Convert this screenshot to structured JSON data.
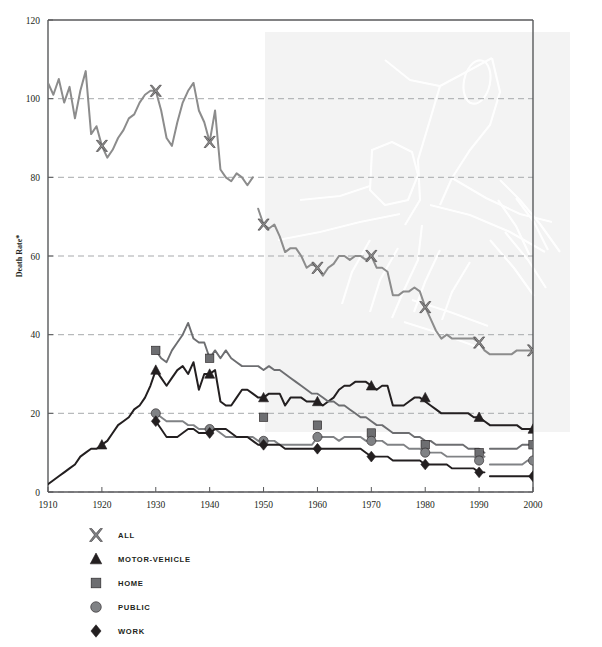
{
  "chart_data": {
    "type": "line",
    "title": "",
    "xlabel": "",
    "ylabel": "Death Rate*",
    "xlim": [
      1910,
      2000
    ],
    "ylim": [
      0,
      120
    ],
    "grid": "horizontal-dashed",
    "legend_position": "below-left",
    "xticks": [
      "1910",
      "1920",
      "1930",
      "1940",
      "1950",
      "1960",
      "1970",
      "1980",
      "1990",
      "2000"
    ],
    "yticks": [
      "0",
      "20",
      "40",
      "60",
      "80",
      "100",
      "120"
    ],
    "annotations": {
      "shaded_band_note": "light grey shaded band spanning 1950-2000 at upper portion of plot, with faint line-art watermark"
    },
    "series": [
      {
        "name": "ALL",
        "marker": "x-cross",
        "color": "#8c8c8c",
        "marker_years": [
          1920,
          1930,
          1940,
          1950,
          1960,
          1970,
          1980,
          1990,
          2000
        ],
        "marker_values": [
          88,
          102,
          89,
          68,
          57,
          60,
          47,
          38,
          36
        ],
        "segments": [
          {
            "x": [
              1910,
              1911,
              1912,
              1913,
              1914,
              1915,
              1916,
              1917,
              1918,
              1919,
              1920,
              1921,
              1922,
              1923,
              1924,
              1925,
              1926,
              1927,
              1928,
              1929,
              1930,
              1931,
              1932,
              1933,
              1934,
              1935,
              1936,
              1937,
              1938,
              1939,
              1940,
              1941,
              1942,
              1943,
              1944,
              1945,
              1946,
              1947,
              1948
            ],
            "y": [
              104,
              101,
              105,
              99,
              103,
              95,
              102,
              107,
              91,
              93,
              88,
              85,
              87,
              90,
              92,
              95,
              96,
              99,
              101,
              102,
              102,
              97,
              90,
              88,
              94,
              99,
              102,
              104,
              97,
              94,
              89,
              97,
              82,
              80,
              79,
              81,
              80,
              78,
              80
            ]
          },
          {
            "x": [
              1949,
              1950,
              1951,
              1952,
              1953,
              1954,
              1955,
              1956,
              1957,
              1958,
              1959,
              1960,
              1961,
              1962,
              1963,
              1964,
              1965,
              1966,
              1967,
              1968,
              1969,
              1970,
              1971,
              1972,
              1973,
              1974,
              1975,
              1976,
              1977,
              1978,
              1979,
              1980,
              1981,
              1982,
              1983,
              1984,
              1985,
              1986,
              1987,
              1988,
              1989,
              1990,
              1991,
              1992,
              1993,
              1994,
              1995,
              1996,
              1997,
              1998,
              1999,
              2000
            ],
            "y": [
              72,
              68,
              67,
              68,
              65,
              61,
              62,
              62,
              60,
              57,
              58,
              57,
              55,
              57,
              58,
              60,
              60,
              59,
              60,
              60,
              59,
              60,
              57,
              57,
              56,
              50,
              50,
              51,
              51,
              52,
              51,
              47,
              44,
              41,
              39,
              40,
              39,
              39,
              39,
              39,
              39,
              38,
              36,
              35,
              35,
              35,
              35,
              35,
              36,
              36,
              36,
              36
            ]
          }
        ]
      },
      {
        "name": "MOTOR-VEHICLE",
        "marker": "triangle",
        "color": "#231f20",
        "marker_years": [
          1920,
          1930,
          1940,
          1950,
          1960,
          1970,
          1980,
          1990,
          2000
        ],
        "marker_values": [
          12,
          31,
          30,
          24,
          23,
          27,
          24,
          19,
          16
        ],
        "segments": [
          {
            "x": [
              1910,
              1911,
              1912,
              1913,
              1914,
              1915,
              1916,
              1917,
              1918,
              1919,
              1920,
              1921,
              1922,
              1923,
              1924,
              1925,
              1926,
              1927,
              1928,
              1929,
              1930,
              1931,
              1932,
              1933,
              1934,
              1935,
              1936,
              1937,
              1938,
              1939,
              1940,
              1941,
              1942,
              1943,
              1944,
              1945,
              1946,
              1947,
              1948,
              1949,
              1950,
              1951,
              1952,
              1953,
              1954,
              1955,
              1956,
              1957,
              1958,
              1959,
              1960,
              1961,
              1962,
              1963,
              1964,
              1965,
              1966,
              1967,
              1968,
              1969,
              1970,
              1971,
              1972,
              1973,
              1974,
              1975,
              1976,
              1977,
              1978,
              1979,
              1980,
              1981,
              1982,
              1983,
              1984,
              1985,
              1986,
              1987,
              1988,
              1989,
              1990,
              1991,
              1992,
              1993,
              1994,
              1995,
              1996,
              1997,
              1998,
              1999,
              2000
            ],
            "y": [
              2,
              3,
              4,
              5,
              6,
              7,
              9,
              10,
              11,
              11,
              12,
              13,
              15,
              17,
              18,
              19,
              21,
              22,
              24,
              27,
              31,
              29,
              27,
              29,
              31,
              32,
              30,
              33,
              26,
              30,
              30,
              31,
              23,
              22,
              22,
              24,
              26,
              26,
              25,
              24,
              24,
              25,
              25,
              25,
              22,
              24,
              24,
              24,
              23,
              23,
              23,
              22,
              23,
              24,
              26,
              27,
              27,
              28,
              28,
              28,
              27,
              26,
              27,
              27,
              22,
              22,
              22,
              23,
              24,
              24,
              23,
              22,
              21,
              20,
              20,
              20,
              20,
              20,
              20,
              19,
              19,
              18,
              17,
              17,
              17,
              17,
              17,
              17,
              16,
              16,
              16
            ]
          }
        ]
      },
      {
        "name": "HOME",
        "marker": "square",
        "color": "#6d6e71",
        "marker_years": [
          1930,
          1940,
          1950,
          1960,
          1970,
          1980,
          1990,
          2000
        ],
        "marker_values": [
          36,
          34,
          19,
          17,
          15,
          12,
          10,
          12
        ],
        "segments": [
          {
            "x": [
              1930,
              1931,
              1932,
              1933,
              1934,
              1935,
              1936,
              1937,
              1938,
              1939,
              1940,
              1941,
              1942,
              1943,
              1944,
              1945,
              1946,
              1947,
              1948,
              1949,
              1950,
              1951,
              1952,
              1953,
              1954,
              1955,
              1956,
              1957,
              1958,
              1959,
              1960,
              1961,
              1962,
              1963,
              1964,
              1965,
              1966,
              1967,
              1968,
              1969,
              1970,
              1971,
              1972,
              1973,
              1974,
              1975,
              1976,
              1977,
              1978,
              1979,
              1980,
              1981,
              1982,
              1983,
              1984,
              1985,
              1986,
              1987,
              1988,
              1989,
              1990,
              1991
            ],
            "y": [
              36,
              34,
              33,
              36,
              38,
              40,
              43,
              39,
              38,
              38,
              34,
              36,
              34,
              36,
              34,
              33,
              32,
              32,
              32,
              32,
              31,
              32,
              31,
              31,
              30,
              29,
              28,
              27,
              26,
              25,
              25,
              24,
              23,
              23,
              22,
              22,
              21,
              20,
              19,
              19,
              18,
              17,
              17,
              16,
              15,
              15,
              15,
              15,
              14,
              14,
              13,
              13,
              12,
              12,
              12,
              12,
              12,
              12,
              11,
              11,
              11,
              10
            ]
          },
          {
            "x": [
              1992,
              1993,
              1994,
              1995,
              1996,
              1997,
              1998,
              1999,
              2000
            ],
            "y": [
              11,
              11,
              11,
              11,
              11,
              11,
              12,
              12,
              12
            ]
          }
        ]
      },
      {
        "name": "PUBLIC",
        "marker": "circle",
        "color": "#808285",
        "marker_years": [
          1930,
          1940,
          1950,
          1960,
          1970,
          1980,
          1990,
          2000
        ],
        "marker_values": [
          20,
          16,
          13,
          14,
          13,
          10,
          8,
          8
        ],
        "segments": [
          {
            "x": [
              1930,
              1931,
              1932,
              1933,
              1934,
              1935,
              1936,
              1937,
              1938,
              1939,
              1940,
              1941,
              1942,
              1943,
              1944,
              1945,
              1946,
              1947,
              1948,
              1949,
              1950,
              1951,
              1952,
              1953,
              1954,
              1955,
              1956,
              1957,
              1958,
              1959,
              1960,
              1961,
              1962,
              1963,
              1964,
              1965,
              1966,
              1967,
              1968,
              1969,
              1970,
              1971,
              1972,
              1973,
              1974,
              1975,
              1976,
              1977,
              1978,
              1979,
              1980,
              1981,
              1982,
              1983,
              1984,
              1985,
              1986,
              1987,
              1988,
              1989,
              1990,
              1991
            ],
            "y": [
              20,
              19,
              18,
              18,
              18,
              18,
              17,
              17,
              16,
              16,
              16,
              16,
              15,
              14,
              14,
              14,
              14,
              14,
              14,
              13,
              13,
              13,
              13,
              12,
              12,
              12,
              12,
              12,
              12,
              12,
              14,
              14,
              14,
              14,
              13,
              14,
              14,
              14,
              14,
              13,
              13,
              13,
              13,
              12,
              12,
              12,
              12,
              11,
              11,
              11,
              10,
              10,
              10,
              10,
              9,
              9,
              9,
              9,
              9,
              9,
              8,
              9
            ]
          },
          {
            "x": [
              1992,
              1993,
              1994,
              1995,
              1996,
              1997,
              1998,
              1999,
              2000
            ],
            "y": [
              7,
              7,
              7,
              7,
              7,
              7,
              7,
              8,
              8
            ]
          }
        ]
      },
      {
        "name": "WORK",
        "marker": "diamond",
        "color": "#231f20",
        "marker_years": [
          1930,
          1940,
          1950,
          1960,
          1970,
          1980,
          1990,
          2000
        ],
        "marker_values": [
          18,
          15,
          12,
          11,
          9,
          7,
          5,
          4
        ],
        "segments": [
          {
            "x": [
              1930,
              1931,
              1932,
              1933,
              1934,
              1935,
              1936,
              1937,
              1938,
              1939,
              1940,
              1941,
              1942,
              1943,
              1944,
              1945,
              1946,
              1947,
              1948,
              1949,
              1950,
              1951,
              1952,
              1953,
              1954,
              1955,
              1956,
              1957,
              1958,
              1959,
              1960,
              1961,
              1962,
              1963,
              1964,
              1965,
              1966,
              1967,
              1968,
              1969,
              1970,
              1971,
              1972,
              1973,
              1974,
              1975,
              1976,
              1977,
              1978,
              1979,
              1980,
              1981,
              1982,
              1983,
              1984,
              1985,
              1986,
              1987,
              1988,
              1989,
              1990,
              1991
            ],
            "y": [
              18,
              16,
              14,
              14,
              14,
              15,
              16,
              16,
              15,
              15,
              15,
              16,
              16,
              16,
              15,
              14,
              14,
              14,
              13,
              12,
              12,
              12,
              12,
              12,
              11,
              11,
              11,
              11,
              11,
              11,
              11,
              11,
              11,
              11,
              11,
              11,
              11,
              11,
              11,
              10,
              9,
              9,
              9,
              9,
              8,
              8,
              8,
              8,
              8,
              8,
              7,
              7,
              7,
              7,
              7,
              6,
              6,
              6,
              6,
              6,
              5,
              5
            ]
          },
          {
            "x": [
              1992,
              1993,
              1994,
              1995,
              1996,
              1997,
              1998,
              1999,
              2000
            ],
            "y": [
              4,
              4,
              4,
              4,
              4,
              4,
              4,
              4,
              4
            ]
          }
        ]
      }
    ]
  },
  "legend": {
    "items": [
      {
        "label": "ALL",
        "marker": "x-cross",
        "color": "#808285"
      },
      {
        "label": "MOTOR-VEHICLE",
        "marker": "triangle",
        "color": "#231f20"
      },
      {
        "label": "HOME",
        "marker": "square",
        "color": "#6d6e71"
      },
      {
        "label": "PUBLIC",
        "marker": "circle",
        "color": "#808285"
      },
      {
        "label": "WORK",
        "marker": "diamond",
        "color": "#231f20"
      }
    ]
  },
  "colors": {
    "axis": "#58595b",
    "gridline": "#a7a9ac",
    "shade_band": "#f2f2f2",
    "background": "#ffffff"
  }
}
